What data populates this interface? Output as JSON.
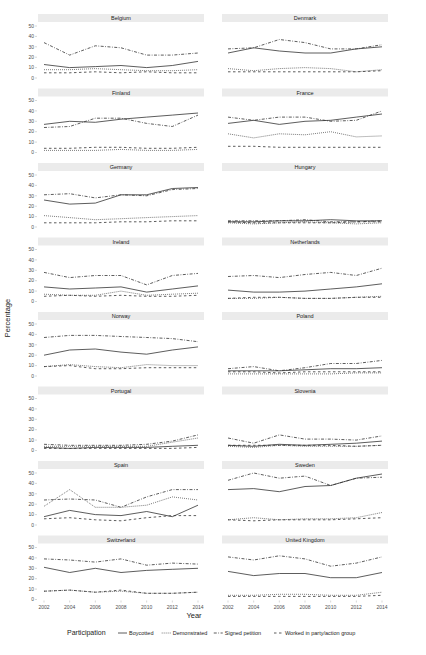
{
  "chart_data": {
    "type": "line",
    "layout": "facet_wrap 8x2",
    "xlabel": "Year",
    "ylabel": "Percentage",
    "ylim": [
      0,
      50
    ],
    "yticks": [
      0,
      10,
      20,
      30,
      40,
      50
    ],
    "xticks": [
      2002,
      2004,
      2006,
      2008,
      2010,
      2012,
      2014
    ],
    "x": [
      2002,
      2004,
      2006,
      2008,
      2010,
      2012,
      2014
    ],
    "legend": {
      "title": "Participation",
      "position": "bottom",
      "entries": [
        {
          "name": "Boycotted",
          "style": "solid"
        },
        {
          "name": "Demonstrated",
          "style": "dotted"
        },
        {
          "name": "Signed petition",
          "style": "dashdot"
        },
        {
          "name": "Worked in party/action group",
          "style": "dashed"
        }
      ]
    },
    "panels": [
      {
        "title": "Belgium",
        "series": {
          "Boycotted": [
            13,
            10,
            11,
            12,
            10,
            12,
            16
          ],
          "Demonstrated": [
            8,
            8,
            9,
            8,
            7,
            7,
            8
          ],
          "Signed petition": [
            34,
            22,
            31,
            29,
            22,
            22,
            24
          ],
          "Worked in party/action group": [
            5,
            5,
            6,
            5,
            6,
            5,
            5
          ]
        }
      },
      {
        "title": "Denmark",
        "series": {
          "Boycotted": [
            24,
            29,
            26,
            24,
            24,
            28,
            30
          ],
          "Demonstrated": [
            9,
            7,
            9,
            10,
            9,
            6,
            8
          ],
          "Signed petition": [
            28,
            29,
            37,
            34,
            28,
            28,
            32
          ],
          "Worked in party/action group": [
            6,
            6,
            6,
            6,
            6,
            6,
            7
          ]
        }
      },
      {
        "title": "Finland",
        "series": {
          "Boycotted": [
            27,
            30,
            29,
            32,
            34,
            36,
            38
          ],
          "Demonstrated": [
            2,
            2,
            2,
            3,
            2,
            2,
            3
          ],
          "Signed petition": [
            24,
            25,
            33,
            33,
            28,
            25,
            36
          ],
          "Worked in party/action group": [
            4,
            4,
            5,
            5,
            4,
            4,
            5
          ]
        }
      },
      {
        "title": "France",
        "series": {
          "Boycotted": [
            28,
            31,
            27,
            30,
            31,
            34,
            37
          ],
          "Demonstrated": [
            18,
            14,
            18,
            17,
            20,
            15,
            16
          ],
          "Signed petition": [
            34,
            31,
            34,
            34,
            30,
            31,
            40
          ],
          "Worked in party/action group": [
            6,
            6,
            5,
            5,
            5,
            5,
            5
          ]
        }
      },
      {
        "title": "Germany",
        "series": {
          "Boycotted": [
            26,
            22,
            23,
            31,
            31,
            37,
            38
          ],
          "Demonstrated": [
            11,
            9,
            7,
            8,
            9,
            10,
            11
          ],
          "Signed petition": [
            31,
            32,
            28,
            31,
            30,
            36,
            37
          ],
          "Worked in party/action group": [
            4,
            4,
            4,
            5,
            5,
            6,
            6
          ]
        }
      },
      {
        "title": "Hungary",
        "series": {
          "Boycotted": [
            5,
            5,
            6,
            6,
            7,
            6,
            6
          ],
          "Demonstrated": [
            4,
            3,
            4,
            5,
            4,
            3,
            4
          ],
          "Signed petition": [
            6,
            6,
            6,
            7,
            5,
            5,
            6
          ],
          "Worked in party/action group": [
            5,
            4,
            4,
            4,
            4,
            5,
            5
          ]
        }
      },
      {
        "title": "Ireland",
        "series": {
          "Boycotted": [
            14,
            12,
            13,
            14,
            9,
            12,
            15
          ],
          "Demonstrated": [
            7,
            6,
            6,
            10,
            6,
            7,
            8
          ],
          "Signed petition": [
            28,
            23,
            25,
            25,
            16,
            25,
            27
          ],
          "Worked in party/action group": [
            5,
            6,
            5,
            6,
            5,
            5,
            6
          ]
        }
      },
      {
        "title": "Netherlands",
        "series": {
          "Boycotted": [
            11,
            9,
            9,
            10,
            12,
            14,
            17
          ],
          "Demonstrated": [
            3,
            3,
            4,
            3,
            3,
            4,
            5
          ],
          "Signed petition": [
            24,
            25,
            23,
            26,
            28,
            25,
            32
          ],
          "Worked in party/action group": [
            3,
            4,
            4,
            3,
            3,
            4,
            4
          ]
        }
      },
      {
        "title": "Norway",
        "series": {
          "Boycotted": [
            20,
            25,
            26,
            23,
            21,
            25,
            28
          ],
          "Demonstrated": [
            9,
            11,
            9,
            8,
            11,
            10,
            10
          ],
          "Signed petition": [
            37,
            39,
            39,
            38,
            37,
            36,
            33
          ],
          "Worked in party/action group": [
            9,
            10,
            7,
            7,
            8,
            8,
            8
          ]
        }
      },
      {
        "title": "Poland",
        "series": {
          "Boycotted": [
            5,
            5,
            5,
            6,
            7,
            7,
            8
          ],
          "Demonstrated": [
            2,
            2,
            2,
            2,
            2,
            3,
            3
          ],
          "Signed petition": [
            7,
            9,
            5,
            8,
            12,
            12,
            15
          ],
          "Worked in party/action group": [
            4,
            4,
            3,
            4,
            4,
            4,
            4
          ]
        }
      },
      {
        "title": "Portugal",
        "series": {
          "Boycotted": [
            3,
            2,
            3,
            3,
            3,
            4,
            5
          ],
          "Demonstrated": [
            4,
            4,
            4,
            4,
            4,
            8,
            12
          ],
          "Signed petition": [
            6,
            5,
            5,
            5,
            6,
            9,
            15
          ],
          "Worked in party/action group": [
            2,
            2,
            2,
            2,
            2,
            2,
            3
          ]
        }
      },
      {
        "title": "Slovenia",
        "series": {
          "Boycotted": [
            5,
            4,
            6,
            5,
            6,
            7,
            9
          ],
          "Demonstrated": [
            4,
            3,
            5,
            4,
            4,
            4,
            5
          ],
          "Signed petition": [
            12,
            7,
            15,
            11,
            11,
            10,
            14
          ],
          "Worked in party/action group": [
            5,
            5,
            5,
            5,
            5,
            4,
            5
          ]
        }
      },
      {
        "title": "Spain",
        "series": {
          "Boycotted": [
            8,
            14,
            10,
            9,
            13,
            8,
            19
          ],
          "Demonstrated": [
            18,
            34,
            17,
            17,
            19,
            27,
            24
          ],
          "Signed petition": [
            24,
            25,
            24,
            17,
            27,
            34,
            34
          ],
          "Worked in party/action group": [
            6,
            7,
            5,
            4,
            7,
            9,
            9
          ]
        }
      },
      {
        "title": "Sweden",
        "series": {
          "Boycotted": [
            34,
            35,
            32,
            37,
            38,
            45,
            49
          ],
          "Demonstrated": [
            5,
            7,
            5,
            6,
            6,
            7,
            12
          ],
          "Signed petition": [
            43,
            50,
            45,
            47,
            38,
            45,
            46
          ],
          "Worked in party/action group": [
            5,
            4,
            5,
            5,
            5,
            6,
            7
          ]
        }
      },
      {
        "title": "Switzerland",
        "series": {
          "Boycotted": [
            31,
            26,
            30,
            26,
            28,
            29,
            30
          ],
          "Demonstrated": [
            8,
            9,
            7,
            8,
            6,
            6,
            7
          ],
          "Signed petition": [
            39,
            38,
            36,
            39,
            33,
            35,
            34
          ],
          "Worked in party/action group": [
            8,
            9,
            7,
            9,
            6,
            6,
            7
          ]
        }
      },
      {
        "title": "United Kingdom",
        "series": {
          "Boycotted": [
            27,
            23,
            25,
            25,
            21,
            21,
            26
          ],
          "Demonstrated": [
            4,
            4,
            5,
            5,
            4,
            4,
            7
          ],
          "Signed petition": [
            41,
            38,
            42,
            39,
            32,
            35,
            41
          ],
          "Worked in party/action group": [
            3,
            3,
            3,
            3,
            3,
            3,
            4
          ]
        }
      }
    ]
  }
}
